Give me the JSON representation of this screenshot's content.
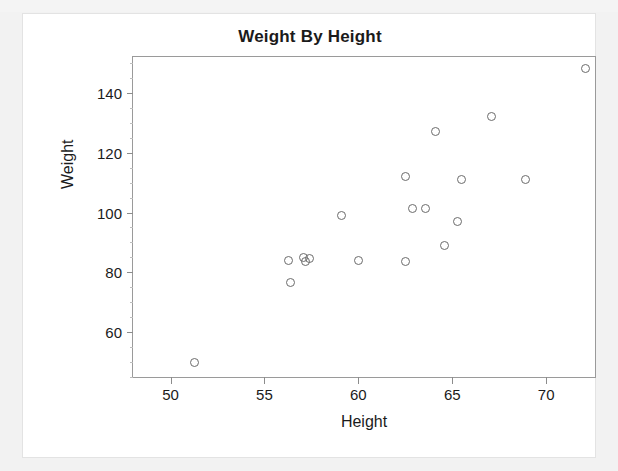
{
  "scan": {
    "top_strip_ghost_text": "",
    "card_background": "#ffffff",
    "page_background": "#f2f2f2"
  },
  "chart_data": {
    "type": "scatter",
    "title": "Weight By Height",
    "xlabel": "Height",
    "ylabel": "Weight",
    "xlim": [
      48.0,
      72.6
    ],
    "ylim": [
      45.0,
      152.0
    ],
    "xticks": [
      50,
      55,
      60,
      65,
      70
    ],
    "yticks": [
      60,
      80,
      100,
      120,
      140
    ],
    "xtick_labels": [
      "50",
      "55",
      "60",
      "65",
      "70"
    ],
    "ytick_labels": [
      "60",
      "80",
      "100",
      "120",
      "140"
    ],
    "grid": false,
    "legend": null,
    "marker": {
      "shape": "open-circle",
      "edge_color": "#6b6b6b",
      "fill_color": "none",
      "size_px": 9
    },
    "frame_color": "#9a9a9a",
    "points": [
      {
        "x": 51.3,
        "y": 50.0
      },
      {
        "x": 56.3,
        "y": 84.0
      },
      {
        "x": 56.4,
        "y": 76.5
      },
      {
        "x": 57.1,
        "y": 85.0
      },
      {
        "x": 57.2,
        "y": 83.5
      },
      {
        "x": 57.4,
        "y": 84.5
      },
      {
        "x": 59.1,
        "y": 99.0
      },
      {
        "x": 60.0,
        "y": 84.0
      },
      {
        "x": 62.5,
        "y": 112.0
      },
      {
        "x": 62.5,
        "y": 83.5
      },
      {
        "x": 62.9,
        "y": 101.5
      },
      {
        "x": 63.6,
        "y": 101.5
      },
      {
        "x": 64.1,
        "y": 127.0
      },
      {
        "x": 64.6,
        "y": 89.0
      },
      {
        "x": 65.3,
        "y": 97.0
      },
      {
        "x": 65.5,
        "y": 111.0
      },
      {
        "x": 67.1,
        "y": 132.0
      },
      {
        "x": 68.9,
        "y": 111.0
      },
      {
        "x": 72.1,
        "y": 148.0
      }
    ]
  }
}
